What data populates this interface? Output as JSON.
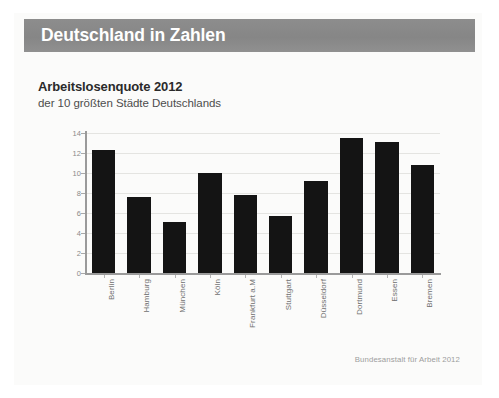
{
  "header": {
    "title": "Deutschland in Zahlen",
    "band_color": "#8b8b8b",
    "title_color": "#ffffff"
  },
  "chart_data": {
    "type": "bar",
    "title": "Arbeitslosenquote 2012",
    "subtitle": "der 10 größten Städte Deutschlands",
    "xlabel": "",
    "ylabel": "",
    "ylim": [
      0,
      14
    ],
    "yticks": [
      0,
      2,
      4,
      6,
      8,
      10,
      12,
      14
    ],
    "ytick_labels": [
      "0",
      "2",
      "4",
      "6",
      "8",
      "10",
      "12",
      "14"
    ],
    "grid": true,
    "legend": "none",
    "bar_color": "#141414",
    "categories": [
      "Berlin",
      "Hamburg",
      "München",
      "Köln",
      "Frankfurt a.M",
      "Stuttgart",
      "Düsseldorf",
      "Dortmund",
      "Essen",
      "Bremen"
    ],
    "values": [
      12.3,
      7.6,
      5.1,
      10.0,
      7.8,
      5.7,
      9.2,
      13.5,
      13.1,
      10.8
    ]
  },
  "source": {
    "text": "Bundesanstalt für Arbeit 2012"
  }
}
